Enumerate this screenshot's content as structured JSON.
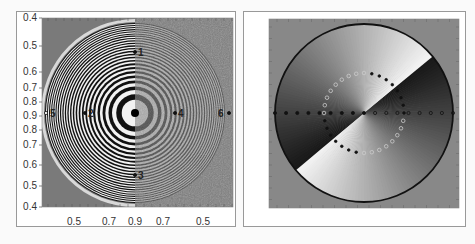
{
  "chart_data": [
    {
      "type": "heatmap",
      "title": "",
      "description": "Concentric ring interference pattern (zone-plate); left half clean, right half noisy reconstruction",
      "y_tick_labels": [
        "0.4",
        "0.5",
        "0.6",
        "0.7",
        "0.8",
        "0.9",
        "0.8",
        "0.7",
        "0.6",
        "0.5",
        "0.4"
      ],
      "x_tick_labels": [
        "0.5",
        "0.7",
        "0.9",
        "0.7",
        "0.5"
      ],
      "points": [
        {
          "label": "1",
          "position": "upper-center"
        },
        {
          "label": "2",
          "position": "center-left"
        },
        {
          "label": "3",
          "position": "lower-center"
        },
        {
          "label": "4",
          "position": "center-right"
        },
        {
          "label": "5",
          "position": "far-left"
        },
        {
          "label": "6",
          "position": "far-right"
        }
      ],
      "colormap": "grayscale"
    },
    {
      "type": "heatmap",
      "title": "",
      "description": "Circular phase map with angular gradient; inner ring of markers and horizontal row of markers",
      "y_tick_labels": [],
      "x_tick_labels": [],
      "colormap": "grayscale",
      "markers": {
        "inner_ring_count": 32,
        "horizontal_row_count": 17
      }
    }
  ],
  "colors": {
    "plot_bg": "#7a7a7a",
    "frame": "#999999",
    "ring_dark": "#111111",
    "ring_light": "#f4f4f4"
  }
}
